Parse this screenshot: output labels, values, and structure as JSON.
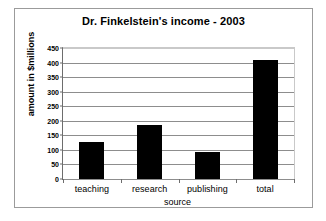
{
  "chart_data": {
    "type": "bar",
    "title": "Dr. Finkelstein's income - 2003",
    "xlabel": "source",
    "ylabel": "amount in $millions",
    "categories": [
      "teaching",
      "research",
      "publishing",
      "total"
    ],
    "values": [
      128,
      185,
      93,
      410
    ],
    "ylim": [
      0,
      450
    ],
    "ytick_labels": [
      "450",
      "400",
      "350",
      "300",
      "250",
      "200",
      "150",
      "100",
      "50",
      "0"
    ],
    "ytick_values": [
      450,
      400,
      350,
      300,
      250,
      200,
      150,
      100,
      50,
      0
    ],
    "ytick_step": 50,
    "grid": true,
    "legend": "none",
    "bar_color": "#000000",
    "gridline_color": "#8d8d8d",
    "frame_color": "#9b9b9b",
    "background_color": "#ffffff"
  }
}
